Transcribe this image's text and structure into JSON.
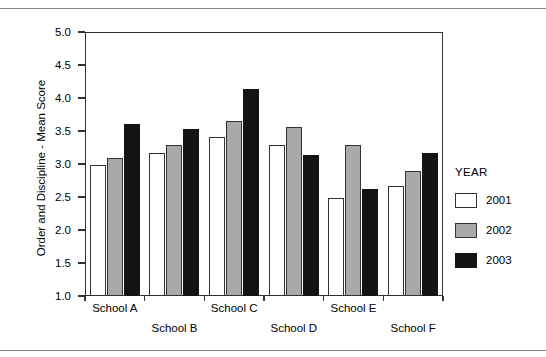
{
  "chart_data": {
    "type": "bar",
    "title": "",
    "xlabel": "",
    "ylabel": "Order and Discipline - Mean Score",
    "ylim": [
      1.0,
      5.0
    ],
    "ytick_labels": [
      "5.0",
      "4.5",
      "4.0",
      "3.5",
      "3.0",
      "2.5",
      "2.0",
      "1.5",
      "1.0"
    ],
    "ytick_values": [
      5.0,
      4.5,
      4.0,
      3.5,
      3.0,
      2.5,
      2.0,
      1.5,
      1.0
    ],
    "grid": false,
    "legend_position": "right",
    "legend_title": "YEAR",
    "categories": [
      "School A",
      "School B",
      "School C",
      "School D",
      "School E",
      "School F"
    ],
    "series": [
      {
        "name": "2001",
        "color": "#ffffff",
        "values": [
          2.98,
          3.16,
          3.41,
          3.29,
          2.49,
          2.67
        ]
      },
      {
        "name": "2002",
        "color": "#a9a9a9",
        "values": [
          3.09,
          3.29,
          3.65,
          3.56,
          3.29,
          2.9
        ]
      },
      {
        "name": "2003",
        "color": "#141414",
        "values": [
          3.61,
          3.53,
          4.13,
          3.14,
          2.62,
          3.16
        ]
      }
    ]
  },
  "axis": {
    "ylabel": "Order and Discipline - Mean Score"
  },
  "legend": {
    "title": "YEAR",
    "items": [
      {
        "label": "2001",
        "swatch": "y2001"
      },
      {
        "label": "2002",
        "swatch": "y2002"
      },
      {
        "label": "2003",
        "swatch": "y2003"
      }
    ]
  }
}
